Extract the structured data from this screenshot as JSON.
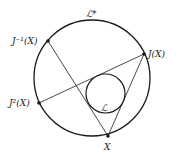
{
  "diagram": {
    "outer_circle": {
      "label": "ℒ*",
      "cx": 92,
      "cy": 78,
      "r": 58
    },
    "inner_circle": {
      "label": "ℒ",
      "cx": 105.5,
      "cy": 93.5,
      "r": 19.5
    },
    "points": [
      {
        "id": "Jinv",
        "label": "J⁻¹(X)",
        "x": 48,
        "y": 41
      },
      {
        "id": "J",
        "label": "J(X)",
        "x": 144,
        "y": 54
      },
      {
        "id": "J2",
        "label": "J²(X)",
        "x": 39,
        "y": 103
      },
      {
        "id": "X",
        "label": "X",
        "x": 108,
        "y": 136
      }
    ],
    "segments": [
      [
        "Jinv",
        "X"
      ],
      [
        "X",
        "J"
      ],
      [
        "J",
        "J2"
      ]
    ],
    "colors": {
      "stroke": "#1a1a1a",
      "background": "#ffffff"
    }
  }
}
